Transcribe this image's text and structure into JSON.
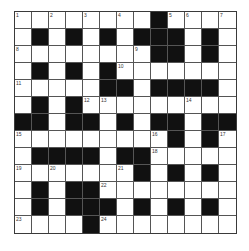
{
  "puzzle": {
    "type": "crossword",
    "rows": 13,
    "cols": 13,
    "layout": [
      "........#....",
      ".#.#.#.###.#.",
      "........##.#.",
      ".#.#.#.......",
      ".....##.####.",
      ".#.#.........",
      "##.##.#.##.##",
      ".........#.#.",
      ".####.##.....",
      ".......#.#.#.",
      ".#.##........",
      ".#.###.#.#.#.",
      "....#........"
    ],
    "numbers": [
      {
        "r": 0,
        "c": 0,
        "n": "1"
      },
      {
        "r": 0,
        "c": 2,
        "n": "2"
      },
      {
        "r": 0,
        "c": 4,
        "n": "3"
      },
      {
        "r": 0,
        "c": 6,
        "n": "4"
      },
      {
        "r": 0,
        "c": 9,
        "n": "5"
      },
      {
        "r": 0,
        "c": 10,
        "n": "6"
      },
      {
        "r": 0,
        "c": 12,
        "n": "7"
      },
      {
        "r": 2,
        "c": 0,
        "n": "8"
      },
      {
        "r": 2,
        "c": 7,
        "n": "9"
      },
      {
        "r": 3,
        "c": 6,
        "n": "10"
      },
      {
        "r": 4,
        "c": 0,
        "n": "11"
      },
      {
        "r": 5,
        "c": 4,
        "n": "12"
      },
      {
        "r": 5,
        "c": 5,
        "n": "13"
      },
      {
        "r": 5,
        "c": 10,
        "n": "14"
      },
      {
        "r": 7,
        "c": 0,
        "n": "15"
      },
      {
        "r": 7,
        "c": 8,
        "n": "16"
      },
      {
        "r": 7,
        "c": 12,
        "n": "17"
      },
      {
        "r": 8,
        "c": 8,
        "n": "18"
      },
      {
        "r": 9,
        "c": 0,
        "n": "19"
      },
      {
        "r": 9,
        "c": 2,
        "n": "20"
      },
      {
        "r": 9,
        "c": 6,
        "n": "21"
      },
      {
        "r": 10,
        "c": 5,
        "n": "22"
      },
      {
        "r": 12,
        "c": 0,
        "n": "23"
      },
      {
        "r": 12,
        "c": 5,
        "n": "24"
      }
    ]
  },
  "colors": {
    "black_cell": "#111111",
    "white_cell": "#ffffff",
    "grid_line": "#555555"
  }
}
